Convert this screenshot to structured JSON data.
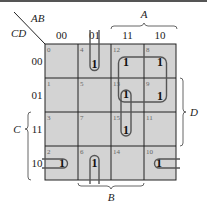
{
  "diagram": {
    "type": "karnaugh-map",
    "variables": {
      "row": "CD",
      "col": "AB"
    },
    "corner_label_top": "AB",
    "corner_label_left": "CD",
    "column_headers": [
      "00",
      "01",
      "11",
      "10"
    ],
    "row_headers": [
      "00",
      "01",
      "11",
      "10"
    ],
    "cells": [
      [
        {
          "index": "0",
          "value": ""
        },
        {
          "index": "4",
          "value": "1"
        },
        {
          "index": "12",
          "value": "1"
        },
        {
          "index": "8",
          "value": "1"
        }
      ],
      [
        {
          "index": "1",
          "value": ""
        },
        {
          "index": "5",
          "value": ""
        },
        {
          "index": "13",
          "value": "1"
        },
        {
          "index": "9",
          "value": "1"
        }
      ],
      [
        {
          "index": "3",
          "value": ""
        },
        {
          "index": "7",
          "value": ""
        },
        {
          "index": "15",
          "value": "1"
        },
        {
          "index": "11",
          "value": ""
        }
      ],
      [
        {
          "index": "2",
          "value": "1"
        },
        {
          "index": "6",
          "value": "1"
        },
        {
          "index": "14",
          "value": ""
        },
        {
          "index": "10",
          "value": "1"
        }
      ]
    ],
    "braces": {
      "A": "A",
      "B": "B",
      "C": "C",
      "D": "D"
    },
    "groups": [
      "cells 12, 8, 13, 9 (quad)",
      "cells 13, 15 (pair)",
      "cell 4 (open top)",
      "cell 6 (open bottom)",
      "cell 2 (wrap left)",
      "cell 10 (wrap right)"
    ],
    "colors": {
      "cell_fill": "#d3d3d3",
      "grid": "#222222",
      "loop": "#555555"
    }
  }
}
